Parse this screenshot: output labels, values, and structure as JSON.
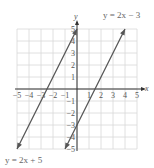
{
  "chart_data": {
    "type": "line",
    "title": "",
    "xlabel": "x",
    "ylabel": "y",
    "xlim": [
      -5,
      5
    ],
    "ylim": [
      -5,
      5
    ],
    "grid": true,
    "x_ticks": [
      "-5",
      "-4",
      "-3",
      "-2",
      "-1",
      "1",
      "2",
      "3",
      "4",
      "5"
    ],
    "y_ticks": [
      "5",
      "4",
      "3",
      "2",
      "1",
      "-1",
      "-2",
      "-3",
      "-4",
      "-5"
    ],
    "series": [
      {
        "name": "y = 2x + 5",
        "slope": 2,
        "intercept": 5,
        "points": [
          [
            -5,
            -5
          ],
          [
            0,
            5
          ]
        ],
        "label_position": "bottom-left"
      },
      {
        "name": "y = 2x − 3",
        "slope": 2,
        "intercept": -3,
        "points": [
          [
            -1,
            -5
          ],
          [
            4,
            5
          ]
        ],
        "label_position": "top-right"
      }
    ],
    "colors": {
      "lines": "#555555",
      "grid": "#d8d8d8",
      "axes": "#333333"
    }
  },
  "labels": {
    "x_axis": "x",
    "y_axis": "y",
    "line1": "y = 2x + 5",
    "line2": "y = 2x − 3"
  }
}
